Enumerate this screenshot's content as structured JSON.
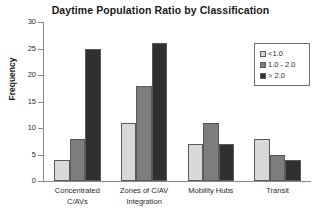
{
  "chart_data": {
    "type": "bar",
    "title": "Daytime Population Ratio by Classification",
    "xlabel": "",
    "ylabel": "Frequency",
    "ylim": [
      0,
      30
    ],
    "yticks": [
      0,
      5,
      10,
      15,
      20,
      25,
      30
    ],
    "grid": false,
    "legend_position": "top-right",
    "categories": [
      "Concentrated C/AVs",
      "Zones of C/AV Integration",
      "Mobility Hubs",
      "Transit"
    ],
    "category_lines": [
      [
        "Concentrated",
        "C/AVs"
      ],
      [
        "Zones of C/AV",
        "Integration"
      ],
      [
        "Mobility Hubs",
        ""
      ],
      [
        "Transit",
        ""
      ]
    ],
    "series": [
      {
        "name": "<1.0",
        "color": "#d8d8d8",
        "values": [
          4,
          11,
          7,
          8
        ]
      },
      {
        "name": "1.0 - 2.0",
        "color": "#7d7d7d",
        "values": [
          8,
          18,
          11,
          5
        ]
      },
      {
        "name": "> 2.0",
        "color": "#303030",
        "values": [
          25,
          26,
          7,
          4
        ]
      }
    ]
  }
}
